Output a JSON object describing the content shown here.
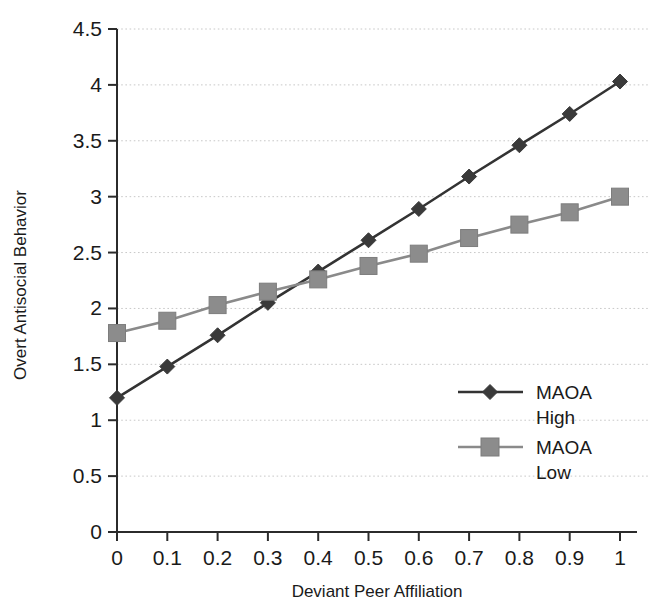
{
  "chart_data": {
    "type": "line",
    "title": "",
    "xlabel": "Deviant Peer Affiliation",
    "ylabel": "Overt Antisocial Behavior",
    "x": [
      0,
      0.1,
      0.2,
      0.3,
      0.4,
      0.5,
      0.6,
      0.7,
      0.8,
      0.9,
      1
    ],
    "xticklabels": [
      "0",
      "0.1",
      "0.2",
      "0.3",
      "0.4",
      "0.5",
      "0.6",
      "0.7",
      "0.8",
      "0.9",
      "1"
    ],
    "yticklabels": [
      "0",
      "0.5",
      "1",
      "1.5",
      "2",
      "2.5",
      "3",
      "3.5",
      "4",
      "4.5"
    ],
    "yticks": [
      0,
      0.5,
      1,
      1.5,
      2,
      2.5,
      3,
      3.5,
      4,
      4.5
    ],
    "xlim": [
      0,
      1
    ],
    "ylim": [
      0,
      4.5
    ],
    "grid": "horizontal-dotted",
    "legend_position": "inside-right-middle",
    "series": [
      {
        "name": "MAOA High",
        "name_line1": "MAOA",
        "name_line2": "High",
        "marker": "diamond",
        "color": "#3a3a3a",
        "values": [
          1.2,
          1.48,
          1.76,
          2.05,
          2.33,
          2.61,
          2.89,
          3.18,
          3.46,
          3.74,
          4.03
        ]
      },
      {
        "name": "MAOA Low",
        "name_line1": "MAOA",
        "name_line2": "Low",
        "marker": "square",
        "color": "#8c8c8c",
        "values": [
          1.78,
          1.89,
          2.03,
          2.15,
          2.26,
          2.38,
          2.49,
          2.63,
          2.75,
          2.86,
          3.0
        ]
      }
    ]
  }
}
